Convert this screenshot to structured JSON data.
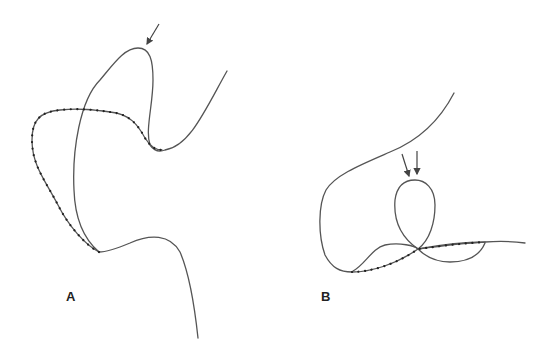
{
  "figure": {
    "panels": [
      {
        "id": "A",
        "label": "A",
        "arrows": 1,
        "description": "Looped curve with a dotted (beaded) segment and single arrow at apex"
      },
      {
        "id": "B",
        "label": "B",
        "arrows": 2,
        "description": "Curve with small loop, double arrows pointing at loop top, dotted segment along base"
      }
    ],
    "colors": {
      "line": "#555555",
      "dots": "#222222",
      "background": "#ffffff"
    }
  }
}
